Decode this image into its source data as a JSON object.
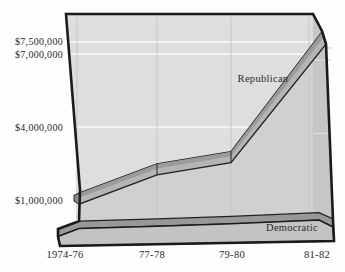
{
  "chart_data": {
    "type": "area",
    "style": "3d-ribbon",
    "title": "",
    "units": "US dollars",
    "categories": [
      "1974-76",
      "77-78",
      "79-80",
      "81-82"
    ],
    "series": [
      {
        "name": "Republican",
        "values_usd_millions": [
          1.3,
          2.5,
          3.0,
          7.9
        ]
      },
      {
        "name": "Democratic",
        "values_usd_millions": [
          0.15,
          0.25,
          0.35,
          0.5
        ]
      }
    ],
    "y_ticks": [
      {
        "label": "$7,500,000",
        "value": 7.5
      },
      {
        "label": "$7,000,000",
        "value": 7.0
      },
      {
        "label": "$4,000,000",
        "value": 4.0
      },
      {
        "label": "$1,000,000",
        "value": 1.0
      }
    ],
    "ylim": [
      0,
      8.2
    ],
    "grid": {
      "horizontal": true,
      "vertical": true
    },
    "legend_position": "inline-labels",
    "colors": {
      "page": "#fdfdfd",
      "wall_above": "#dedede",
      "wall_below": "#d0d0d0",
      "side_face": "#c6c6c6",
      "base_front": "#c3c3c3",
      "ribbon_top_face": "#9b9b9b",
      "ribbon_front_face": "#b5b5b5",
      "ribbon_end_cap": "#8a8a8a",
      "dem_band": "#989898",
      "outline": "#1a1a1a",
      "h_gridline": "#f4f4f4",
      "v_gridline": "#c9c9c9",
      "text": "#2a2a2a"
    }
  }
}
